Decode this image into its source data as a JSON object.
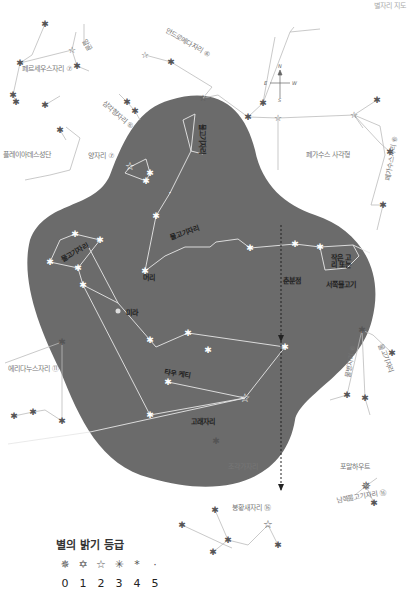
{
  "corner_text": "별자리 지도",
  "labels": {
    "perseus": "페르세우스자리 ⑦",
    "algol": "알골",
    "andromeda": "안드로메다자리 ⑥",
    "triangulum": "삼각형자리 ⑥",
    "pleiades": "플레이아데스성단",
    "aries": "양자리 ⑦",
    "pegasus_square": "페가수스 사각형",
    "pegasus": "페가수스자리 ⑥",
    "pisces_north": "물고기자리",
    "pisces_upper": "물고기자리",
    "pisces_west": "물고기자리",
    "mirach": "머리",
    "circlet": "작은 고리 또는",
    "western_fish": "서쪽물고기",
    "vernal": "춘분점",
    "mira": "미라",
    "eridanus": "에리다누스자리 ⑪",
    "tau_ceti": "타우 케티",
    "cetus": "고래자리",
    "aquarius": "물병자리 ⑥",
    "aquarius2": "물고기자리",
    "sculptor": "조각가자리",
    "fomalhaut": "포말하우트",
    "piscis_austrinus": "남쪽물고기자리 ⑯",
    "phoenix": "봉황새자리 ⑯"
  },
  "compass": {
    "n": "N",
    "e": "E",
    "w": "W",
    "s": "S"
  },
  "legend": {
    "title": "별의 밝기 등급",
    "glyphs": [
      "✵",
      "✡",
      "☆",
      "✳",
      "*",
      "·"
    ],
    "magnitudes": [
      "0",
      "1",
      "2",
      "3",
      "4",
      "5"
    ]
  },
  "colors": {
    "sky_region": "#6b6b6b",
    "line": "#c8c8c8",
    "star_light": "#ffffff",
    "star_dark": "#555555",
    "label": "#777777"
  }
}
